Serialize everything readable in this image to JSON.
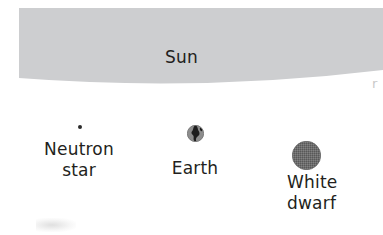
{
  "figure": {
    "background_color": "#ffffff",
    "text_color": "#231f20"
  },
  "sun": {
    "label": "Sun",
    "fill_color": "#cdced0",
    "shape": "curved-band-arc",
    "note": "Large gray arc spanning the full width across the top"
  },
  "objects": [
    {
      "id": "neutron-star",
      "label_line1": "Neutron",
      "label_line2": "star",
      "marker": "tiny-dot",
      "marker_color": "#2b2b2b",
      "marker_diameter_px": 4
    },
    {
      "id": "earth",
      "label_line1": "Earth",
      "label_line2": "",
      "marker": "small-disc-with-continents",
      "marker_color": "#8a8a8a",
      "marker_detail_color": "#1d1d1d",
      "marker_diameter_px": 17
    },
    {
      "id": "white-dwarf",
      "label_line1": "White",
      "label_line2": "dwarf",
      "marker": "textured-disc",
      "marker_color": "#6f6f6f",
      "marker_diameter_px": 29
    }
  ],
  "artifacts": {
    "edge_glyph": "r",
    "smudge_present": true
  }
}
